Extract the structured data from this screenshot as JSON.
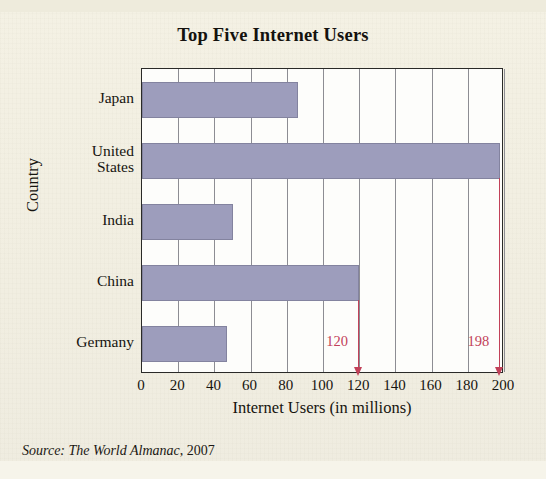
{
  "figure": {
    "background_color": "#f1eee1",
    "source_note_prefix": "Source",
    "source_note_work": "The World Almanac",
    "source_note_year": ", 2007"
  },
  "chart_data": {
    "type": "bar",
    "orientation": "horizontal",
    "title": "Top Five Internet Users",
    "xlabel": "Internet Users (in millions)",
    "ylabel": "Country",
    "categories": [
      "Japan",
      "United\nStates",
      "India",
      "China",
      "Germany"
    ],
    "values": [
      86,
      198,
      50,
      120,
      47
    ],
    "xlim": [
      0,
      200
    ],
    "ylim": [
      0,
      5
    ],
    "xticks": [
      0,
      20,
      40,
      60,
      80,
      100,
      120,
      140,
      160,
      180,
      200
    ],
    "xtick_labels": [
      "0",
      "20",
      "40",
      "60",
      "80",
      "100",
      "120",
      "140",
      "160",
      "180",
      "200"
    ],
    "grid": true,
    "grid_axis": "x",
    "legend": false,
    "bar_color": "#9d9dbc",
    "bar_edge_color": "#83839f",
    "grid_color": "#8d8d93",
    "annotation_color": "#c24159",
    "annotations": [
      {
        "label": "120",
        "value": 120,
        "series": "China"
      },
      {
        "label": "198",
        "value": 198,
        "series": "United States"
      }
    ]
  }
}
